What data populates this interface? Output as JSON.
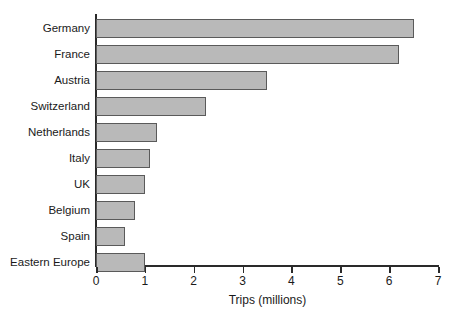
{
  "chart_data": {
    "type": "bar",
    "orientation": "horizontal",
    "title": "",
    "subtitle": "",
    "xlabel": "Trips (millions)",
    "ylabel": "",
    "xlim": [
      0,
      7
    ],
    "xticks": [
      0,
      1,
      2,
      3,
      4,
      5,
      6,
      7
    ],
    "xtick_labels": [
      "0",
      "1",
      "2",
      "3",
      "4",
      "5",
      "6",
      "7"
    ],
    "grid": false,
    "legend": false,
    "legend_position": "none",
    "categories": [
      "Germany",
      "France",
      "Austria",
      "Switzerland",
      "Netherlands",
      "Italy",
      "UK",
      "Belgium",
      "Spain",
      "Eastern Europe"
    ],
    "values": [
      6.5,
      6.2,
      3.5,
      2.25,
      1.25,
      1.1,
      1.0,
      0.8,
      0.6,
      1.0
    ],
    "series": [
      {
        "name": "Trips",
        "values": [
          6.5,
          6.2,
          3.5,
          2.25,
          1.25,
          1.1,
          1.0,
          0.8,
          0.6,
          1.0
        ]
      }
    ],
    "colors": {
      "bar_fill": "#b9b9b9",
      "bar_border": "#5a5a5a",
      "axis": "#2a2a2a",
      "text": "#1a1a1a",
      "background": "#ffffff"
    }
  }
}
